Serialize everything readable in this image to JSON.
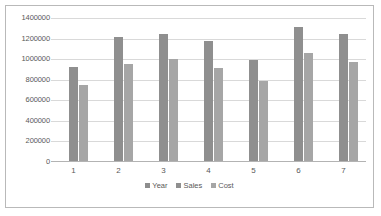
{
  "chart_data": {
    "type": "bar",
    "title": "",
    "subtitle": "",
    "xlabel": "",
    "ylabel": "",
    "categories": [
      "1",
      "2",
      "3",
      "4",
      "5",
      "6",
      "7"
    ],
    "series": [
      {
        "name": "Year",
        "color": "#8d8d8d",
        "values": [
          2008,
          2009,
          2010,
          2011,
          2012,
          2013,
          2014
        ]
      },
      {
        "name": "Sales",
        "color": "#8f8f8f",
        "values": [
          920000,
          1220000,
          1240000,
          1175000,
          995000,
          1310000,
          1245000
        ]
      },
      {
        "name": "Cost",
        "color": "#a6a6a6",
        "values": [
          750000,
          955000,
          1000000,
          915000,
          785000,
          1060000,
          975000
        ]
      }
    ],
    "ylim": [
      0,
      1400000
    ],
    "ytick_step": 200000,
    "ytick_labels": [
      "0",
      "200000",
      "400000",
      "600000",
      "800000",
      "1000000",
      "1200000",
      "1400000"
    ],
    "grid": true,
    "grid_axis": "y",
    "legend_position": "bottom",
    "annotations": []
  },
  "frame": {
    "border_color": "#b9b9b9",
    "background": "#ffffff"
  }
}
